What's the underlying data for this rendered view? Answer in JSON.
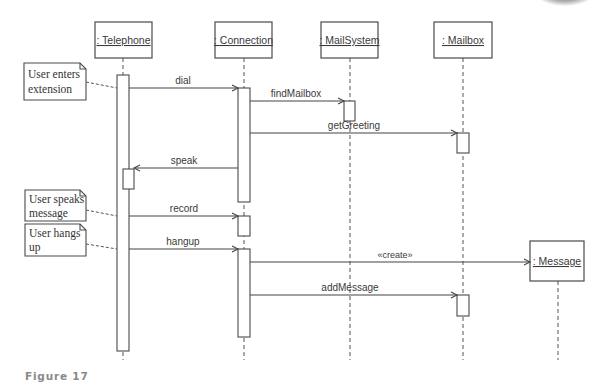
{
  "diagram": {
    "type": "UML sequence diagram",
    "objects": [
      {
        "id": "telephone",
        "label": ": Telephone"
      },
      {
        "id": "connection",
        "label": ": Connection"
      },
      {
        "id": "mailsystem",
        "label": ": MailSystem"
      },
      {
        "id": "mailbox",
        "label": ": Mailbox"
      },
      {
        "id": "message",
        "label": ": Message"
      }
    ],
    "messages": [
      {
        "from": "telephone",
        "to": "connection",
        "label": "dial"
      },
      {
        "from": "connection",
        "to": "mailsystem",
        "label": "findMailbox"
      },
      {
        "from": "connection",
        "to": "mailbox",
        "label": "getGreeting"
      },
      {
        "from": "connection",
        "to": "telephone",
        "label": "speak"
      },
      {
        "from": "telephone",
        "to": "connection",
        "label": "record"
      },
      {
        "from": "telephone",
        "to": "connection",
        "label": "hangup"
      },
      {
        "from": "connection",
        "to": "message",
        "label": "«create»"
      },
      {
        "from": "connection",
        "to": "mailbox",
        "label": "addMessage"
      }
    ],
    "notes": [
      {
        "line1": "User enters",
        "line2": "extension"
      },
      {
        "line1": "User speaks",
        "line2": "message"
      },
      {
        "line1": "User hangs",
        "line2": "up"
      }
    ]
  },
  "caption": "Figure 17"
}
